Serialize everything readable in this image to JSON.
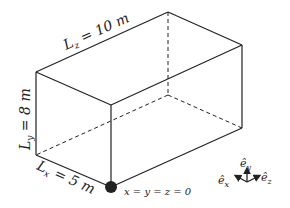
{
  "labels": {
    "lz": "L_z = 10 m",
    "lz_main": "L",
    "lz_sub": "z",
    "lz_rest": " = 10 m",
    "ly_main": "L",
    "ly_sub": "y",
    "ly_rest": " = 8 m",
    "lx_main": "L",
    "lx_sub": "x",
    "lx_rest": " = 5 m",
    "origin": "x = y = z = 0"
  },
  "axes": {
    "ex": "ê",
    "ex_sub": "x",
    "ey": "ê",
    "ey_sub": "y",
    "ez": "ê",
    "ez_sub": "z"
  },
  "colors": {
    "line": "#222222",
    "background": "#ffffff"
  }
}
